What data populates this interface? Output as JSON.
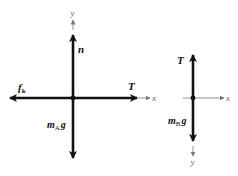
{
  "diagram": {
    "type": "free-body diagrams",
    "colors": {
      "force": "#111111",
      "axis": "#777777",
      "background": "#ffffff"
    },
    "body_A": {
      "axes": {
        "x": "x",
        "y": "y"
      },
      "forces": [
        {
          "name": "normal",
          "label": "n",
          "direction": "up"
        },
        {
          "name": "friction",
          "label": "f",
          "subscript": "k",
          "direction": "left"
        },
        {
          "name": "tension",
          "label": "T",
          "direction": "right"
        },
        {
          "name": "weight",
          "label": "m",
          "subscript": "A",
          "suffix": "g",
          "direction": "down"
        }
      ]
    },
    "body_B": {
      "axes": {
        "x": "x",
        "y": "y"
      },
      "forces": [
        {
          "name": "tension",
          "label": "T",
          "direction": "up"
        },
        {
          "name": "weight",
          "label": "m",
          "subscript": "B",
          "suffix": "g",
          "direction": "down"
        }
      ]
    }
  }
}
